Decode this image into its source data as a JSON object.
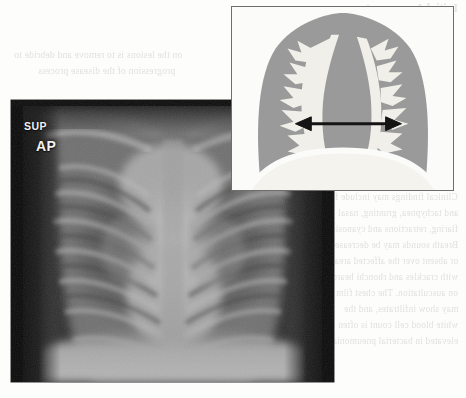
{
  "figure": {
    "type": "medical-radiograph-with-schematic-inset",
    "modality": "chest radiograph"
  },
  "xray": {
    "name": "pediatric-ap-chest-radiograph",
    "labels": {
      "orientation": "SUP",
      "projection": "AP"
    },
    "colors": {
      "border": "#0b0b0b",
      "lung_field": "#6d6d6d",
      "mediastinum": "#b4b4b4",
      "background": "#121212",
      "label_text": "#f2f2f0"
    }
  },
  "inset": {
    "name": "cardiothoracic-schematic",
    "colors": {
      "frame": "#6e6e6e",
      "soft_tissue": "#9a9a9a",
      "lung_rib_white": "#f0efe9",
      "arrow": "#141414",
      "paper": "#fbfbfa"
    },
    "annotation": {
      "arrow_kind": "double-headed-horizontal",
      "measures": "transverse cardiac diameter"
    }
  },
  "ghost_text": {
    "note": "faint show-through text from the reverse of the printed page (mirrored, illegible)",
    "header": "Initial Assessment",
    "lines_left": [
      "on the lesions is to remove and debride to",
      "progression of the disease process"
    ],
    "lines_right": [
      "Clinical findings may include fever",
      "and tachypnea, grunting, nasal",
      "flaring, retractions and cyanosis.",
      "Breath sounds may be decreased",
      "or absent over the affected area,",
      "with crackles and rhonchi heard",
      "on auscultation. The chest film",
      "may show infiltrates, and the",
      "white blood cell count is often",
      "elevated in bacterial pneumonia."
    ]
  }
}
